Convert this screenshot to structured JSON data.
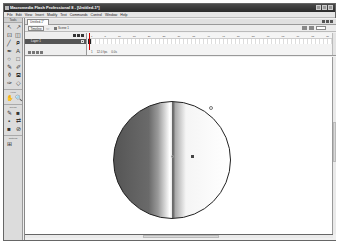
{
  "window": {
    "title": "Macromedia Flash Professional 8 - [Untitled-1*]"
  },
  "menubar": {
    "items": [
      "File",
      "Edit",
      "View",
      "Insert",
      "Modify",
      "Text",
      "Commands",
      "Control",
      "Window",
      "Help"
    ]
  },
  "tools": {
    "header": "Tools",
    "items": [
      "arrow-tool",
      "subselect-tool",
      "free-transform-tool",
      "gradient-transform-tool",
      "line-tool",
      "lasso-tool",
      "pen-tool",
      "text-tool",
      "oval-tool",
      "rectangle-tool",
      "pencil-tool",
      "brush-tool",
      "ink-bottle-tool",
      "paint-bucket-tool",
      "eyedropper-tool",
      "eraser-tool"
    ],
    "glyphs": [
      "↖",
      "↗",
      "⊡",
      "◫",
      "╱",
      "ᑭ",
      "✒",
      "A",
      "○",
      "□",
      "✎",
      "✐",
      "⚱",
      "⛾",
      "✑",
      "◇"
    ],
    "view_label": "View",
    "view_glyphs": [
      "✋",
      "🔍"
    ],
    "colors_label": "Colors",
    "colors_glyphs": [
      "✎",
      "■",
      "▪",
      "⇄",
      "■",
      "⊘"
    ],
    "options_label": "Options",
    "options_glyphs": [
      "⊞"
    ]
  },
  "document": {
    "tab_label": "Untitled-1*",
    "timeline_button": "Timeline",
    "back_glyph": "⇦",
    "scene_label": "Scene 1",
    "zoom_value": "100%"
  },
  "timeline": {
    "ruler_ticks": [
      "1",
      "5",
      "10",
      "15",
      "20",
      "25",
      "30",
      "35",
      "40",
      "45",
      "50",
      "55",
      "60",
      "65",
      "70",
      "75",
      "80"
    ],
    "layer_name": "Layer 1",
    "status": [
      "1",
      "12.0 fps",
      "0.0s"
    ]
  },
  "stage": {
    "shape": "circle",
    "fill": "linear-gradient",
    "stroke_color": "#222222"
  }
}
